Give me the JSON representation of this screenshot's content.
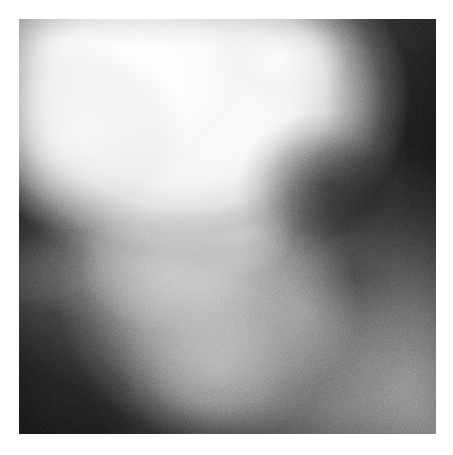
{
  "document": {
    "type": "scanned-figure",
    "medium": "grayscale radiograph",
    "page_background": "#ffffff",
    "caption": "",
    "label": ""
  },
  "plate": {
    "name": "radiograph-plate",
    "x": 19,
    "y": 19,
    "width": 417,
    "height": 415,
    "border_color": "#ffffff",
    "alt_text": ""
  },
  "tones": {
    "paper_white": "#ffffff",
    "highlight_peak": "#fdfdfd",
    "bright_mass": "#f2f2f2",
    "mid_gray_mass": "#b4b4b4",
    "field_gray": "#8e8e8e",
    "shadow_gray": "#4a4a4a",
    "deep_shadow": "#1a1a1a",
    "black_point": "#101010"
  },
  "regions": [
    {
      "id": "mass-upper-bright",
      "label": "bright upper mass",
      "tone": "#fdfdfd",
      "center_x_pct": 40,
      "center_y_pct": 19
    },
    {
      "id": "mass-upper-left-lobe",
      "label": "bright left lobe",
      "tone": "#f0f0f0",
      "center_x_pct": 14,
      "center_y_pct": 28
    },
    {
      "id": "mass-center-gray",
      "label": "central mid-gray mass",
      "tone": "#c0c0c0",
      "center_x_pct": 45,
      "center_y_pct": 66
    },
    {
      "id": "mass-lower-lobe",
      "label": "lower tapering lobe",
      "tone": "#b4b4b4",
      "center_x_pct": 48,
      "center_y_pct": 84
    },
    {
      "id": "tone-right-dark",
      "label": "dark right field",
      "tone": "#1e1e1e",
      "center_x_pct": 104,
      "center_y_pct": 30
    },
    {
      "id": "tone-bottomleft-dark",
      "label": "dark lower-left field",
      "tone": "#121212",
      "center_x_pct": -8,
      "center_y_pct": 104
    },
    {
      "id": "tone-bottomright-lift",
      "label": "medium gray lower-right field",
      "tone": "#6f6f6f",
      "center_x_pct": 92,
      "center_y_pct": 88
    },
    {
      "id": "notch-right-dark",
      "label": "dark notch at right mid-height",
      "tone": "#242424",
      "center_x_pct": 74,
      "center_y_pct": 40
    }
  ],
  "grain": {
    "label": "film grain",
    "coarse_frequency": "0.72",
    "fine_frequency": "1.8",
    "coarse_opacity": "0.42",
    "fine_opacity": "0.5"
  }
}
